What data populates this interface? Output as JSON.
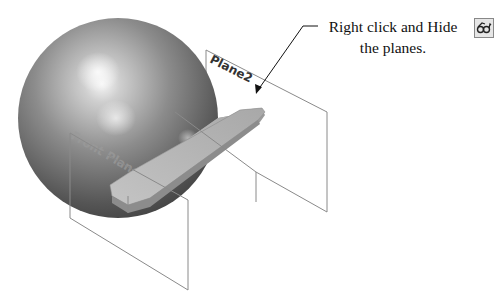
{
  "callout": {
    "line1": "Right click and Hide",
    "line2": "the planes.",
    "icon": "hide-eyeglasses-icon"
  },
  "planes": [
    {
      "label": "Plane2"
    },
    {
      "label": "Front Plane"
    }
  ],
  "colors": {
    "sphere_dark": "#3a3a3a",
    "sphere_light": "#f4f4f4",
    "wing_face": "#b8b8b8",
    "plane_edge": "#8a8a8a",
    "text": "#111111"
  }
}
